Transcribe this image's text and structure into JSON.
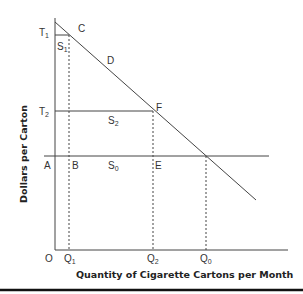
{
  "diagram": {
    "type": "economics-tax-demand-diagram",
    "x_axis_title": "Quantity of Cigarette Cartons per Month",
    "y_axis_title": "Dollars per Carton",
    "origin_label": "O",
    "y_labels": [
      {
        "main": "T",
        "sub": "1"
      },
      {
        "main": "T",
        "sub": "2"
      },
      {
        "main": "A",
        "sub": ""
      }
    ],
    "x_labels": [
      {
        "main": "Q",
        "sub": "1"
      },
      {
        "main": "Q",
        "sub": "2"
      },
      {
        "main": "Q",
        "sub": "0"
      }
    ],
    "region_labels": [
      {
        "main": "C",
        "sub": ""
      },
      {
        "main": "D",
        "sub": ""
      },
      {
        "main": "S",
        "sub": "1"
      },
      {
        "main": "F",
        "sub": ""
      },
      {
        "main": "S",
        "sub": "2"
      },
      {
        "main": "B",
        "sub": ""
      },
      {
        "main": "S",
        "sub": "0"
      },
      {
        "main": "E",
        "sub": ""
      }
    ],
    "colors": {
      "line": "#444444",
      "text": "#333333",
      "rule": "#111111"
    }
  }
}
